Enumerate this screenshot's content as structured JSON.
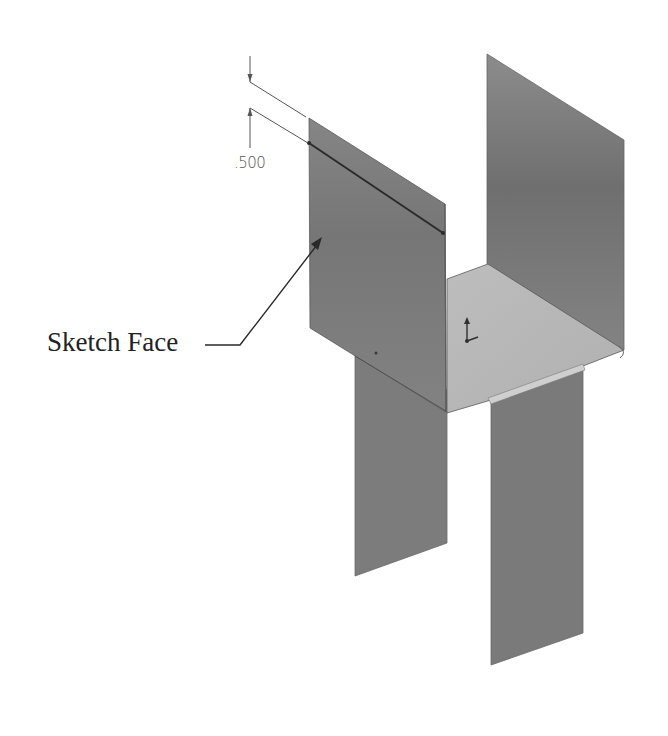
{
  "callout": {
    "label": "Sketch Face"
  },
  "dimension": {
    "value": ".500"
  },
  "colors": {
    "background": "#ffffff",
    "panel_dark": "#7d7d7d",
    "panel_mid": "#8a8a8a",
    "floor": "#b9b9b9",
    "edge": "#3a3a3a",
    "dim_line": "#555555",
    "label": "#222222"
  }
}
